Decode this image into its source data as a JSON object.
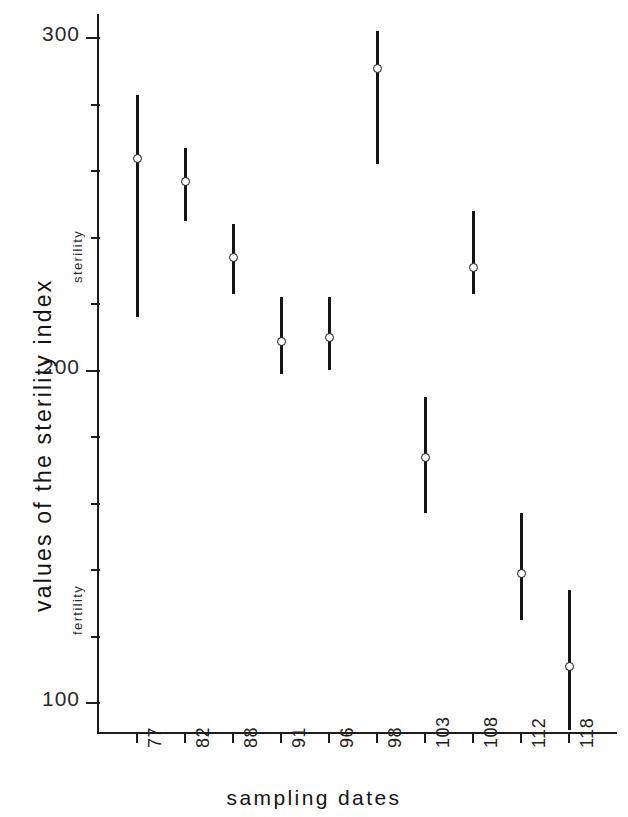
{
  "chart_data": {
    "type": "scatter",
    "title": "",
    "xlabel": "sampling dates",
    "ylabel": "values of the sterility index",
    "categories": [
      "77",
      "82",
      "88",
      "91",
      "96",
      "98",
      "103",
      "108",
      "112",
      "118"
    ],
    "values": [
      264,
      257,
      234,
      209,
      210,
      291,
      174,
      231,
      139,
      111
    ],
    "error_low": [
      281,
      245,
      223,
      199,
      200,
      262,
      157,
      223,
      125,
      92
    ],
    "error_high": [
      282,
      267,
      244,
      222,
      222,
      302,
      192,
      248,
      157,
      134
    ],
    "series": [
      {
        "name": "sterility index",
        "points": [
          {
            "x": "77",
            "y": 264,
            "low": 216,
            "high": 283
          },
          {
            "x": "82",
            "y": 257,
            "low": 245,
            "high": 267
          },
          {
            "x": "88",
            "y": 234,
            "low": 223,
            "high": 244
          },
          {
            "x": "91",
            "y": 209,
            "low": 199,
            "high": 222
          },
          {
            "x": "96",
            "y": 210,
            "low": 200,
            "high": 222
          },
          {
            "x": "98",
            "y": 291,
            "low": 262,
            "high": 302
          },
          {
            "x": "103",
            "y": 174,
            "low": 157,
            "high": 192
          },
          {
            "x": "108",
            "y": 231,
            "low": 223,
            "high": 248
          },
          {
            "x": "112",
            "y": 139,
            "low": 125,
            "high": 157
          },
          {
            "x": "118",
            "y": 111,
            "low": 92,
            "high": 134
          }
        ]
      }
    ],
    "ylim": [
      90,
      310
    ],
    "y_major_ticks": [
      100,
      200,
      300
    ],
    "y_major_labels": [
      "100",
      "200",
      "300"
    ],
    "y_minor_tick_step": 20,
    "grid": false,
    "legend": null,
    "annotations": [
      {
        "text": "sterility",
        "orientation": "vertical",
        "region": "upper"
      },
      {
        "text": "fertility",
        "orientation": "vertical",
        "region": "lower"
      }
    ],
    "marker_style": "open-circle",
    "error_bar_style": "vertical-line"
  },
  "axis": {
    "y_labels": [
      "300",
      "200",
      "100"
    ],
    "y_title": "values of the sterility index",
    "x_title": "sampling dates",
    "x_labels": [
      "77",
      "82",
      "88",
      "91",
      "96",
      "98",
      "103",
      "108",
      "112",
      "118"
    ],
    "region_upper_label": "sterility",
    "region_lower_label": "fertility"
  },
  "colors": {
    "axis": "#1d1d1d",
    "data": "#141414",
    "marker_fill": "#ffffff",
    "background": "#ffffff"
  }
}
